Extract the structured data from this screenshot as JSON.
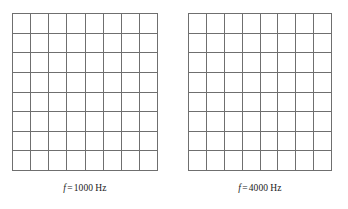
{
  "figure": {
    "background_color": "#ffffff",
    "grid_line_color": "#6f6f6f",
    "text_color": "#1a1a1a"
  },
  "panels": [
    {
      "id": "panel-1000hz",
      "grid": {
        "rows": 8,
        "columns": 8,
        "cells_empty": true
      },
      "caption": {
        "symbol": "f",
        "equals": "=",
        "value": "1000",
        "unit": "Hz",
        "full_text": "f = 1000 Hz"
      }
    },
    {
      "id": "panel-4000hz",
      "grid": {
        "rows": 8,
        "columns": 8,
        "cells_empty": true
      },
      "caption": {
        "symbol": "f",
        "equals": "=",
        "value": "4000",
        "unit": "Hz",
        "full_text": "f = 4000 Hz"
      }
    }
  ]
}
